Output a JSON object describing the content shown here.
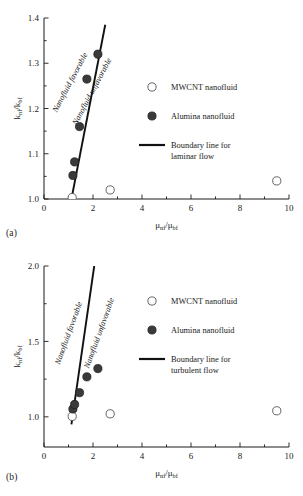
{
  "figure": {
    "panels": [
      {
        "tag": "(a)",
        "chart_data": {
          "type": "scatter",
          "title": "",
          "subtitle": "",
          "xlabel": "μnf/μbf",
          "ylabel": "knf/kbf",
          "xlim": [
            0,
            10
          ],
          "ylim": [
            1.0,
            1.4
          ],
          "xticks": [
            0,
            2,
            4,
            6,
            8,
            10
          ],
          "xtick_labels": [
            "0",
            "2",
            "4",
            "6",
            "8",
            "10"
          ],
          "xminor_step": 1,
          "yticks": [
            1.0,
            1.1,
            1.2,
            1.3,
            1.4
          ],
          "ytick_labels": [
            "1.0",
            "1.1",
            "1.2",
            "1.3",
            "1.4"
          ],
          "yminor_step": 0.05,
          "grid": false,
          "legend_position": "center-right",
          "series": [
            {
              "name": "MWCNT nanofluid",
              "marker": "open-circle",
              "points": [
                {
                  "x": 1.15,
                  "y": 1.003
                },
                {
                  "x": 2.7,
                  "y": 1.02
                },
                {
                  "x": 9.5,
                  "y": 1.04
                }
              ]
            },
            {
              "name": "Alumina nanofluid",
              "marker": "filled-circle",
              "points": [
                {
                  "x": 1.18,
                  "y": 1.052
                },
                {
                  "x": 1.25,
                  "y": 1.082
                },
                {
                  "x": 1.45,
                  "y": 1.16
                },
                {
                  "x": 1.75,
                  "y": 1.265
                },
                {
                  "x": 2.2,
                  "y": 1.32
                }
              ]
            }
          ],
          "boundary_line": {
            "name": "Boundary line for laminar flow",
            "points": [
              {
                "x": 1.12,
                "y": 1.0
              },
              {
                "x": 2.5,
                "y": 1.385
              }
            ]
          },
          "annotations": [
            {
              "text": "Nanofluid favorable",
              "x": 1.15,
              "y": 1.255,
              "rotation": -62
            },
            {
              "text": "Nanofluid unfavorable",
              "x": 2.05,
              "y": 1.235,
              "rotation": -62
            }
          ]
        },
        "legend": [
          {
            "label": "MWCNT nanofluid",
            "marker": "open-circle"
          },
          {
            "label": "Alumina nanofluid",
            "marker": "filled-circle"
          },
          {
            "label": "Boundary line for",
            "label2": "laminar flow",
            "marker": "line"
          }
        ]
      },
      {
        "tag": "(b)",
        "chart_data": {
          "type": "scatter",
          "title": "",
          "subtitle": "",
          "xlabel": "μnf/μbf",
          "ylabel": "knf/kbf",
          "xlim": [
            0,
            10
          ],
          "ylim": [
            0.8,
            2.0
          ],
          "xticks": [
            0,
            2,
            4,
            6,
            8,
            10
          ],
          "xtick_labels": [
            "0",
            "2",
            "4",
            "6",
            "8",
            "10"
          ],
          "xminor_step": 1,
          "yticks": [
            1.0,
            1.5,
            2.0
          ],
          "ytick_labels": [
            "1.0",
            "1.5",
            "2.0"
          ],
          "yminor_step": 0.25,
          "grid": false,
          "legend_position": "center-right",
          "series": [
            {
              "name": "MWCNT nanofluid",
              "marker": "open-circle",
              "points": [
                {
                  "x": 1.15,
                  "y": 1.003
                },
                {
                  "x": 2.7,
                  "y": 1.02
                },
                {
                  "x": 9.5,
                  "y": 1.04
                }
              ]
            },
            {
              "name": "Alumina nanofluid",
              "marker": "filled-circle",
              "points": [
                {
                  "x": 1.18,
                  "y": 1.052
                },
                {
                  "x": 1.25,
                  "y": 1.082
                },
                {
                  "x": 1.45,
                  "y": 1.16
                },
                {
                  "x": 1.75,
                  "y": 1.265
                },
                {
                  "x": 2.2,
                  "y": 1.32
                }
              ]
            }
          ],
          "boundary_line": {
            "name": "Boundary line for turbulent flow",
            "points": [
              {
                "x": 1.12,
                "y": 0.95
              },
              {
                "x": 2.05,
                "y": 2.0
              }
            ]
          },
          "annotations": [
            {
              "text": "Nanofluid favorable",
              "x": 1.1,
              "y": 1.55,
              "rotation": -70
            },
            {
              "text": "Nanofluid unfavorable",
              "x": 2.35,
              "y": 1.55,
              "rotation": -70
            }
          ]
        },
        "legend": [
          {
            "label": "MWCNT nanofluid",
            "marker": "open-circle"
          },
          {
            "label": "Alumina nanofluid",
            "marker": "filled-circle"
          },
          {
            "label": "Boundary line for",
            "label2": "turbulent flow",
            "marker": "line"
          }
        ]
      }
    ]
  },
  "colors": {
    "axis": "#1a1a1a",
    "filled_marker": "#3a3a3a",
    "open_marker": "#ffffff",
    "boundary": "#111111",
    "background": "#ffffff"
  }
}
